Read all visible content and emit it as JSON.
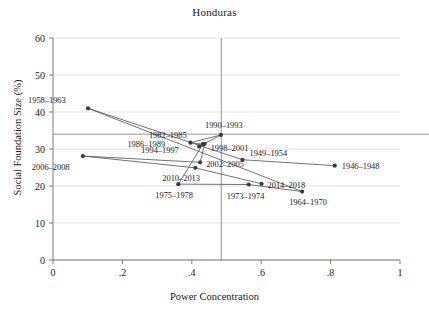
{
  "chart_data": {
    "type": "scatter",
    "title": "Honduras",
    "xlabel": "Power Concentration",
    "ylabel": "Social Foundation Size (%)",
    "xlim": [
      0,
      1
    ],
    "ylim": [
      0,
      60
    ],
    "xticks": [
      0,
      0.2,
      0.4,
      0.6,
      0.8,
      1
    ],
    "xticklabels": [
      "0",
      ".2",
      ".4",
      ".6",
      ".8",
      "1"
    ],
    "yticks": [
      0,
      10,
      20,
      30,
      40,
      50,
      60
    ],
    "yticklabels": [
      "0",
      "10",
      "20",
      "30",
      "40",
      "50",
      "60"
    ],
    "grid": true,
    "legend": "none",
    "connected": true,
    "reference_lines": {
      "vertical_x": 0.485,
      "horizontal_y": 34.0
    },
    "marker_color": "#3c3c3c",
    "line_color": "#5a5a5a",
    "points": [
      {
        "label": "1946–1948",
        "x": 0.812,
        "y": 25.5,
        "label_dx": 7,
        "label_dy": 3
      },
      {
        "label": "1949–1954",
        "x": 0.546,
        "y": 27.1,
        "label_dx": 7,
        "label_dy": -4
      },
      {
        "label": "1958–1963",
        "x": 0.101,
        "y": 41.0,
        "label_dx": -60,
        "label_dy": -5
      },
      {
        "label": "1964–1970",
        "x": 0.718,
        "y": 18.5,
        "label_dx": -13,
        "label_dy": 13
      },
      {
        "label": "1973–1974",
        "x": 0.564,
        "y": 20.4,
        "label_dx": -22,
        "label_dy": 14
      },
      {
        "label": "1975–1978",
        "x": 0.361,
        "y": 20.5,
        "label_dx": -23,
        "label_dy": 14
      },
      {
        "label": "1982–1985",
        "x": 0.432,
        "y": 31.3,
        "label_dx": -54,
        "label_dy": -6
      },
      {
        "label": "1986–1989",
        "x": 0.396,
        "y": 31.7,
        "label_dx": -63,
        "label_dy": 4
      },
      {
        "label": "1990–1993",
        "x": 0.484,
        "y": 33.8,
        "label_dx": -16,
        "label_dy": -7
      },
      {
        "label": "1994–1997",
        "x": 0.421,
        "y": 30.7,
        "label_dx": -58,
        "label_dy": 7
      },
      {
        "label": "1998–2001",
        "x": 0.437,
        "y": 31.4,
        "label_dx": 6,
        "label_dy": 7
      },
      {
        "label": "2002–2005",
        "x": 0.424,
        "y": 26.4,
        "label_dx": 6,
        "label_dy": 5
      },
      {
        "label": "2006–2008",
        "x": 0.086,
        "y": 28.1,
        "label_dx": -51,
        "label_dy": 14
      },
      {
        "label": "2010–2013",
        "x": 0.41,
        "y": 24.9,
        "label_dx": -33,
        "label_dy": 13
      },
      {
        "label": "2014–2018",
        "x": 0.601,
        "y": 20.6,
        "label_dx": 6,
        "label_dy": 4
      }
    ],
    "path_order": [
      "1946–1948",
      "1949–1954",
      "1958–1963",
      "1964–1970",
      "1973–1974",
      "1975–1978",
      "1982–1985",
      "1986–1989",
      "1990–1993",
      "1994–1997",
      "1998–2001",
      "2002–2005",
      "2006–2008",
      "2010–2013",
      "2014–2018"
    ]
  }
}
